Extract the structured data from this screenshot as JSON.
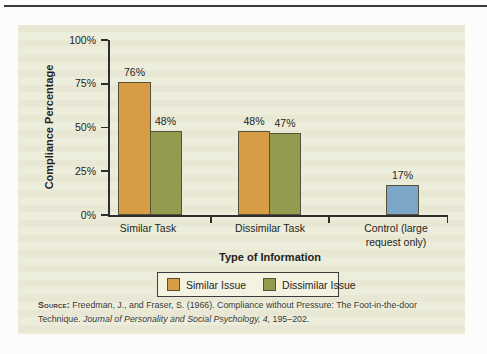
{
  "figure": {
    "source_label": "Source:",
    "source_line1": " Freedman, J., and Fraser, S. (1966). Compliance without Pressure: The Foot-in-the-door",
    "source_line2_start": "Technique. ",
    "source_line2_italic": "Journal of Personality and Social Psychology, 4,",
    "source_line2_end": " 195–202."
  },
  "colors": {
    "panel_background": "#ecedda",
    "similar_issue_bar": "#d89d44",
    "dissimilar_issue_bar": "#949a4e",
    "control_bar": "#7ba6c7",
    "bar_outline": "#55513a",
    "axis": "#2e2e2e",
    "legend_background": "#f4f3e2"
  },
  "chart_data": {
    "type": "bar",
    "title": "",
    "xlabel": "Type of Information",
    "ylabel": "Compliance Percentage",
    "ylim": [
      0,
      100
    ],
    "yticks": [
      "0%",
      "25%",
      "50%",
      "75%",
      "100%"
    ],
    "grid": false,
    "legend_position": "bottom",
    "legend": [
      {
        "label": "Similar Issue",
        "color": "#d89d44"
      },
      {
        "label": "Dissimilar Issue",
        "color": "#949a4e"
      }
    ],
    "categories": [
      "Similar Task",
      "Dissimilar Task",
      "Control (large request only)"
    ],
    "groups": [
      {
        "category": "Similar Task",
        "bars": [
          {
            "series": "Similar Issue",
            "value": 76,
            "label": "76%",
            "color": "#d89d44"
          },
          {
            "series": "Dissimilar Issue",
            "value": 48,
            "label": "48%",
            "color": "#949a4e"
          }
        ]
      },
      {
        "category": "Dissimilar Task",
        "bars": [
          {
            "series": "Similar Issue",
            "value": 48,
            "label": "48%",
            "color": "#d89d44"
          },
          {
            "series": "Dissimilar Issue",
            "value": 47,
            "label": "47%",
            "color": "#949a4e"
          }
        ]
      },
      {
        "category": "Control (large request only)",
        "bars": [
          {
            "series": "Control",
            "value": 17,
            "label": "17%",
            "color": "#7ba6c7"
          }
        ]
      }
    ]
  }
}
